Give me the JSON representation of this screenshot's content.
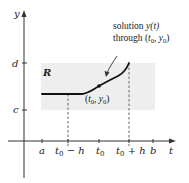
{
  "diagram": {
    "axes": {
      "x_label": "t",
      "y_label": "y"
    },
    "y_ticks": [
      {
        "label": "d"
      },
      {
        "label": "c"
      }
    ],
    "x_ticks": [
      {
        "label": "a"
      },
      {
        "label_main": "t",
        "label_sub": "0",
        "label_suffix": " − h"
      },
      {
        "label_main": "t",
        "label_sub": "0",
        "label_suffix": ""
      },
      {
        "label_main": "t",
        "label_sub": "0",
        "label_suffix": " + h"
      },
      {
        "label": "b"
      }
    ],
    "region_label": "R",
    "point_label": {
      "open": "(",
      "t": "t",
      "t_sub": "0",
      "sep": ", ",
      "y": "y",
      "y_sub": "0",
      "close": ")"
    },
    "annotation": {
      "line1_prefix": "solution ",
      "line1_func": "y(t)",
      "line2_prefix": "through (",
      "line2_t": "t",
      "line2_t_sub": "0",
      "line2_sep": ", ",
      "line2_y": "y",
      "line2_y_sub": "0",
      "line2_close": ")"
    },
    "colors": {
      "region_fill": "#eeeeee",
      "curve": "#111111",
      "axis": "#333333",
      "dashed": "#555555"
    }
  }
}
